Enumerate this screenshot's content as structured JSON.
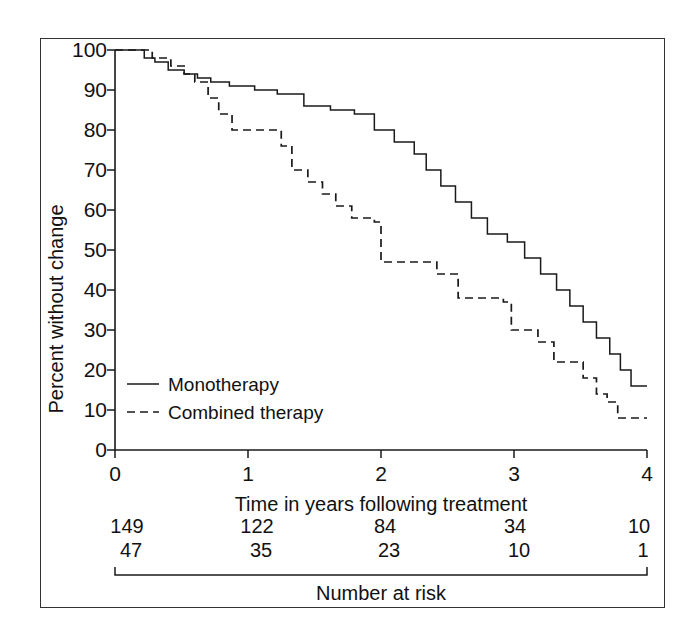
{
  "chart_data": {
    "type": "line",
    "title": "",
    "xlabel": "Time in years following treatment",
    "ylabel": "Percent without change",
    "xlim": [
      0,
      4
    ],
    "ylim": [
      0,
      100
    ],
    "xticks": [
      "0",
      "1",
      "2",
      "3",
      "4"
    ],
    "yticks": [
      "0",
      "10",
      "20",
      "30",
      "40",
      "50",
      "60",
      "70",
      "80",
      "90",
      "100"
    ],
    "grid": false,
    "legend_position": "lower-left-inside",
    "series": [
      {
        "name": "Monotherapy",
        "style": "solid",
        "color": "#1a1a1a",
        "points": [
          [
            0.0,
            100
          ],
          [
            0.22,
            100
          ],
          [
            0.22,
            98
          ],
          [
            0.3,
            98
          ],
          [
            0.3,
            97
          ],
          [
            0.4,
            97
          ],
          [
            0.4,
            95
          ],
          [
            0.52,
            95
          ],
          [
            0.52,
            94
          ],
          [
            0.62,
            94
          ],
          [
            0.62,
            93
          ],
          [
            0.72,
            93
          ],
          [
            0.72,
            92
          ],
          [
            0.86,
            92
          ],
          [
            0.86,
            91
          ],
          [
            1.05,
            91
          ],
          [
            1.05,
            90
          ],
          [
            1.22,
            90
          ],
          [
            1.22,
            89
          ],
          [
            1.42,
            89
          ],
          [
            1.42,
            86
          ],
          [
            1.62,
            86
          ],
          [
            1.62,
            85
          ],
          [
            1.8,
            85
          ],
          [
            1.8,
            84
          ],
          [
            1.95,
            84
          ],
          [
            1.95,
            80
          ],
          [
            2.1,
            80
          ],
          [
            2.1,
            77
          ],
          [
            2.25,
            77
          ],
          [
            2.25,
            74
          ],
          [
            2.34,
            74
          ],
          [
            2.34,
            70
          ],
          [
            2.45,
            70
          ],
          [
            2.45,
            66
          ],
          [
            2.56,
            66
          ],
          [
            2.56,
            62
          ],
          [
            2.68,
            62
          ],
          [
            2.68,
            58
          ],
          [
            2.8,
            58
          ],
          [
            2.8,
            54
          ],
          [
            2.95,
            54
          ],
          [
            2.95,
            52
          ],
          [
            3.08,
            52
          ],
          [
            3.08,
            48
          ],
          [
            3.2,
            48
          ],
          [
            3.2,
            44
          ],
          [
            3.32,
            44
          ],
          [
            3.32,
            40
          ],
          [
            3.42,
            40
          ],
          [
            3.42,
            36
          ],
          [
            3.52,
            36
          ],
          [
            3.52,
            32
          ],
          [
            3.62,
            32
          ],
          [
            3.62,
            28
          ],
          [
            3.72,
            28
          ],
          [
            3.72,
            24
          ],
          [
            3.8,
            24
          ],
          [
            3.8,
            20
          ],
          [
            3.88,
            20
          ],
          [
            3.88,
            16
          ],
          [
            4.0,
            16
          ]
        ]
      },
      {
        "name": "Combined therapy",
        "style": "dashed",
        "color": "#1a1a1a",
        "points": [
          [
            0.0,
            100
          ],
          [
            0.28,
            100
          ],
          [
            0.28,
            98
          ],
          [
            0.42,
            98
          ],
          [
            0.42,
            96
          ],
          [
            0.52,
            96
          ],
          [
            0.52,
            94
          ],
          [
            0.6,
            94
          ],
          [
            0.6,
            92
          ],
          [
            0.7,
            92
          ],
          [
            0.7,
            88
          ],
          [
            0.78,
            88
          ],
          [
            0.78,
            84
          ],
          [
            0.88,
            84
          ],
          [
            0.88,
            80
          ],
          [
            1.25,
            80
          ],
          [
            1.25,
            76
          ],
          [
            1.33,
            76
          ],
          [
            1.33,
            70
          ],
          [
            1.45,
            70
          ],
          [
            1.45,
            67
          ],
          [
            1.56,
            67
          ],
          [
            1.56,
            64
          ],
          [
            1.66,
            64
          ],
          [
            1.66,
            61
          ],
          [
            1.78,
            61
          ],
          [
            1.78,
            58
          ],
          [
            1.95,
            58
          ],
          [
            1.95,
            57
          ],
          [
            2.0,
            57
          ],
          [
            2.0,
            47
          ],
          [
            2.42,
            47
          ],
          [
            2.42,
            44
          ],
          [
            2.58,
            44
          ],
          [
            2.58,
            38
          ],
          [
            2.92,
            38
          ],
          [
            2.92,
            37
          ],
          [
            2.98,
            37
          ],
          [
            2.98,
            30
          ],
          [
            3.18,
            30
          ],
          [
            3.18,
            27
          ],
          [
            3.3,
            27
          ],
          [
            3.3,
            22
          ],
          [
            3.52,
            22
          ],
          [
            3.52,
            18
          ],
          [
            3.62,
            18
          ],
          [
            3.62,
            14
          ],
          [
            3.7,
            14
          ],
          [
            3.7,
            12
          ],
          [
            3.78,
            12
          ],
          [
            3.78,
            8
          ],
          [
            4.0,
            8
          ]
        ]
      }
    ],
    "risk_table": {
      "caption": "Number at risk",
      "times": [
        "0",
        "1",
        "2",
        "3",
        "4"
      ],
      "rows": [
        {
          "series": "Monotherapy",
          "values": [
            "149",
            "122",
            "84",
            "34",
            "10"
          ]
        },
        {
          "series": "Combined therapy",
          "values": [
            "47",
            "35",
            "23",
            "10",
            "1"
          ]
        }
      ]
    }
  }
}
